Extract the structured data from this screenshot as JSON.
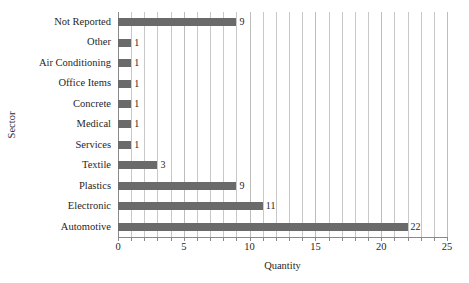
{
  "chart_data": {
    "type": "bar",
    "orientation": "horizontal",
    "title": "",
    "xlabel": "Quantity",
    "ylabel": "Sector",
    "categories": [
      "Not Reported",
      "Other",
      "Air Conditioning",
      "Office Items",
      "Concrete",
      "Medical",
      "Services",
      "Textile",
      "Plastics",
      "Electronic",
      "Automotive"
    ],
    "values": [
      9,
      1,
      1,
      1,
      1,
      1,
      1,
      3,
      9,
      11,
      22
    ],
    "value_labels": [
      "9",
      "1",
      "1",
      "1",
      "1",
      "1",
      "1",
      "3",
      "9",
      "11",
      "22"
    ],
    "xlim": [
      0,
      25
    ],
    "xticks": [
      0,
      5,
      10,
      15,
      20,
      25
    ],
    "xtick_labels": [
      "0",
      "5",
      "10",
      "15",
      "20",
      "25"
    ],
    "minor_gridline_step": 1,
    "grid": "vertical-only",
    "legend": "none",
    "bar_color": "#6a6a6a",
    "gridline_color": "#c8c8c8",
    "axis_color": "#8a8a8a",
    "text_color": "#1f1f1f",
    "background_color": "#ffffff"
  }
}
